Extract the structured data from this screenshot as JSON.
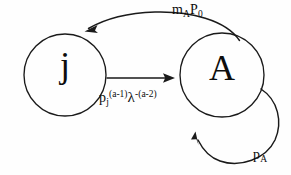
{
  "diagram": {
    "type": "state-transition-diagram",
    "background_color": "#fefefe",
    "stroke_color": "#1a1a1a",
    "nodes": [
      {
        "id": "j",
        "label": "j",
        "cx": 65,
        "cy": 75,
        "r": 41,
        "shape": "circle"
      },
      {
        "id": "A",
        "label": "A",
        "cx": 222,
        "cy": 75,
        "r": 42,
        "shape": "circle"
      }
    ],
    "edges": [
      {
        "id": "A-to-j",
        "from": "A",
        "to": "j",
        "style": "curved-arc-above",
        "label_parts": {
          "base1": "m",
          "sub1": "A",
          "base2": "P",
          "sub2": "0"
        },
        "label_plain": "mAP0"
      },
      {
        "id": "j-to-A",
        "from": "j",
        "to": "A",
        "style": "straight-horizontal",
        "label_parts": {
          "base1": "p",
          "sub1": "j",
          "sup1": "(a-1)",
          "base2": "λ",
          "sup2": "-(a-2)"
        },
        "label_plain": "pj(a-1)λ-(a-2)"
      },
      {
        "id": "A-self-loop",
        "from": "A",
        "to": "A",
        "style": "self-loop-right",
        "label_parts": {
          "base1": "p",
          "sub1": "A"
        },
        "label_plain": "pA"
      }
    ]
  }
}
